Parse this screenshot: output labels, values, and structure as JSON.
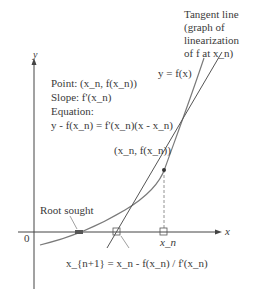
{
  "axes": {
    "x_label": "x",
    "y_label": "y",
    "origin_label": "0"
  },
  "annotations": {
    "tangent_line": [
      "Tangent line",
      "(graph of",
      "linearization",
      "of f at x_n)"
    ],
    "curve_label": "y = f(x)",
    "point_info": {
      "point": "Point: (x_n, f(x_n))",
      "slope": "Slope: f'(x_n)",
      "equation_heading": "Equation:",
      "equation": "y - f(x_n) = f'(x_n)(x - x_n)"
    },
    "tangent_point_label": "(x_n, f(x_n))",
    "root_label": "Root sought",
    "xn_label": "x_n",
    "next_iterate_formula": "x_{n+1} = x_n - f(x_n) / f'(x_n)"
  }
}
